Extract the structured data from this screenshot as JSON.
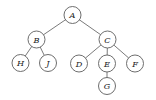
{
  "figure": {
    "kind": "rooted-tree-diagram",
    "width": 156,
    "height": 100,
    "background_color": "#ffffff",
    "node_fill_color": "#ffffff",
    "node_stroke_color": "#5e5e5e",
    "edge_color": "#6b6b6b",
    "label_color": "#1a1a1a",
    "node_radius": 8.5
  },
  "nodes": [
    {
      "id": "A",
      "label": "A",
      "x": 72.5,
      "y": 15.0,
      "depth": 0
    },
    {
      "id": "B",
      "label": "B",
      "x": 36.5,
      "y": 39.5,
      "depth": 1
    },
    {
      "id": "C",
      "label": "C",
      "x": 107.5,
      "y": 39.5,
      "depth": 1
    },
    {
      "id": "H",
      "label": "H",
      "x": 20.5,
      "y": 63.0,
      "depth": 2
    },
    {
      "id": "J",
      "label": "J",
      "x": 48.0,
      "y": 63.0,
      "depth": 2
    },
    {
      "id": "D",
      "label": "D",
      "x": 79.0,
      "y": 63.5,
      "depth": 2
    },
    {
      "id": "E",
      "label": "E",
      "x": 107.0,
      "y": 63.5,
      "depth": 2
    },
    {
      "id": "F",
      "label": "F",
      "x": 135.0,
      "y": 63.5,
      "depth": 2
    },
    {
      "id": "G",
      "label": "G",
      "x": 107.0,
      "y": 86.0,
      "depth": 3
    }
  ],
  "edges": [
    {
      "from": "A",
      "to": "B"
    },
    {
      "from": "A",
      "to": "C"
    },
    {
      "from": "B",
      "to": "H"
    },
    {
      "from": "B",
      "to": "J"
    },
    {
      "from": "C",
      "to": "D"
    },
    {
      "from": "C",
      "to": "E"
    },
    {
      "from": "C",
      "to": "F"
    },
    {
      "from": "E",
      "to": "G"
    }
  ]
}
